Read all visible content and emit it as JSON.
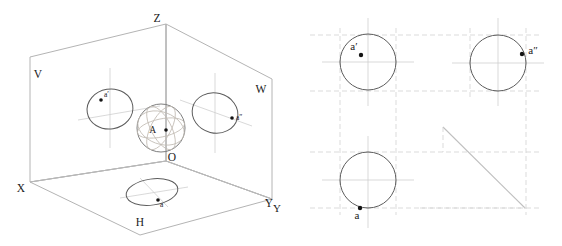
{
  "figure": {
    "background_color": "#ffffff",
    "width": 562,
    "height": 246
  },
  "left_panel": {
    "name": "pictorial-three-plane-projection",
    "plane_labels": [
      {
        "id": "V",
        "text": "V",
        "x": 38,
        "y": 78,
        "meaning": "vertical-projection-plane"
      },
      {
        "id": "W",
        "text": "W",
        "x": 261,
        "y": 93,
        "meaning": "profile-projection-plane"
      },
      {
        "id": "H",
        "text": "H",
        "x": 140,
        "y": 226,
        "meaning": "horizontal-projection-plane"
      }
    ],
    "axis_labels": [
      {
        "id": "Z",
        "text": "Z",
        "x": 157,
        "y": 22,
        "meaning": "z-axis"
      },
      {
        "id": "X",
        "text": "X",
        "x": 21,
        "y": 192,
        "meaning": "x-axis"
      },
      {
        "id": "Y",
        "text": "Y",
        "x": 269,
        "y": 207,
        "meaning": "y-axis"
      },
      {
        "id": "O",
        "text": "O",
        "x": 172,
        "y": 161,
        "meaning": "origin"
      }
    ],
    "point_labels": [
      {
        "id": "A",
        "text": "A",
        "x": 156,
        "y": 133,
        "meaning": "point-A-on-sphere"
      },
      {
        "id": "a-prime",
        "text": "a′",
        "x": 104,
        "y": 97,
        "meaning": "frontal-projection-of-A"
      },
      {
        "id": "a-dblprime",
        "text": "a″",
        "x": 236,
        "y": 116,
        "meaning": "profile-projection-of-A"
      },
      {
        "id": "a",
        "text": "a",
        "x": 160,
        "y": 204,
        "meaning": "horizontal-projection-of-A"
      }
    ],
    "markers": [
      {
        "id": "A-dot",
        "cx": 166,
        "cy": 130,
        "r": 1.8
      },
      {
        "id": "a-prime-dot",
        "cx": 101,
        "cy": 100,
        "r": 1.8
      },
      {
        "id": "a-dbl-dot",
        "cx": 232,
        "cy": 118,
        "r": 1.8
      },
      {
        "id": "a-dot",
        "cx": 158,
        "cy": 200,
        "r": 1.8
      }
    ]
  },
  "right_panel": {
    "name": "orthographic-three-view-layout",
    "axis_labels": [
      {
        "id": "Y-right",
        "text": "Y",
        "x": 277,
        "y": 210,
        "meaning": "y-axis"
      }
    ],
    "point_labels": [
      {
        "id": "a-prime",
        "text": "a′",
        "x": 354,
        "y": 47,
        "meaning": "frontal-projection-of-A"
      },
      {
        "id": "a-dblprime",
        "text": "a″",
        "x": 528,
        "y": 51,
        "meaning": "profile-projection-of-A"
      },
      {
        "id": "a",
        "text": "a",
        "x": 355,
        "y": 216,
        "meaning": "horizontal-projection-of-A"
      }
    ],
    "markers": [
      {
        "id": "a-prime-dot",
        "cx": 361,
        "cy": 55,
        "r": 2.2
      },
      {
        "id": "a-dbl-dot",
        "cx": 522,
        "cy": 54,
        "r": 2.2
      },
      {
        "id": "a-dot",
        "cx": 360,
        "cy": 208,
        "r": 2.2
      }
    ],
    "views": [
      {
        "id": "front-view",
        "cx": 368,
        "cy": 62,
        "r": 28,
        "label": "front view"
      },
      {
        "id": "profile-view",
        "cx": 498,
        "cy": 63,
        "r": 28,
        "label": "profile view"
      },
      {
        "id": "top-view",
        "cx": 368,
        "cy": 180,
        "r": 28,
        "label": "top view"
      }
    ]
  },
  "colors": {
    "ink": "#1a1a1a",
    "outline": "#5c5c5c",
    "sphere": "#6e6e6e",
    "construction": "#d2d2d2",
    "box_edge": "#b4b4b4",
    "great_circle": "#c2bcb4",
    "miter": "#bfbfbf"
  }
}
